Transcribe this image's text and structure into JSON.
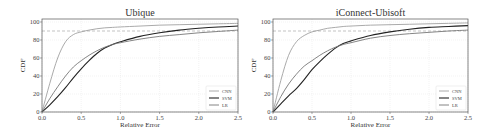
{
  "chart_data": [
    {
      "type": "line",
      "title": "Ubique",
      "xlabel": "Relative Error",
      "ylabel": "CDF",
      "xlim": [
        0,
        2.5
      ],
      "ylim": [
        0,
        100
      ],
      "xticks": [
        "0.0",
        "0.5",
        "1.0",
        "1.5",
        "2.0",
        "2.5"
      ],
      "yticks": [
        "0",
        "20",
        "40",
        "60",
        "80",
        "100"
      ],
      "grid": true,
      "reference_line": {
        "y": 90,
        "style": "dashed"
      },
      "legend_position": "lower right",
      "x": [
        0,
        0.1,
        0.2,
        0.3,
        0.4,
        0.5,
        0.6,
        0.7,
        0.8,
        0.9,
        1.0,
        1.25,
        1.5,
        1.75,
        2.0,
        2.25,
        2.5
      ],
      "series": [
        {
          "name": "CNN",
          "color": "#a0a0a0",
          "values": [
            0,
            32,
            60,
            78,
            86,
            89,
            91,
            92.5,
            93.5,
            94,
            94.5,
            95.5,
            96.5,
            97,
            97.5,
            98,
            98.5
          ]
        },
        {
          "name": "SVM",
          "color": "#222222",
          "values": [
            0,
            8,
            17,
            27,
            38,
            48,
            57,
            65,
            71,
            75,
            78,
            84,
            88,
            91,
            93,
            94.5,
            95.5
          ]
        },
        {
          "name": "LR",
          "color": "#777777",
          "values": [
            0,
            15,
            28,
            40,
            50,
            57,
            63,
            68,
            72,
            75,
            77,
            81,
            84,
            86,
            88,
            89.5,
            91
          ]
        }
      ]
    },
    {
      "type": "line",
      "title": "iConnect-Ubisoft",
      "xlabel": "Relative Error",
      "ylabel": "CDF",
      "xlim": [
        0,
        2.5
      ],
      "ylim": [
        0,
        100
      ],
      "xticks": [
        "0.0",
        "0.5",
        "1.0",
        "1.5",
        "2.0",
        "2.5"
      ],
      "yticks": [
        "0",
        "20",
        "40",
        "60",
        "80",
        "100"
      ],
      "grid": true,
      "reference_line": {
        "y": 90,
        "style": "dashed"
      },
      "legend_position": "lower right",
      "x": [
        0,
        0.1,
        0.2,
        0.3,
        0.4,
        0.5,
        0.6,
        0.7,
        0.8,
        0.9,
        1.0,
        1.25,
        1.5,
        1.75,
        2.0,
        2.25,
        2.5
      ],
      "series": [
        {
          "name": "CNN",
          "color": "#a0a0a0",
          "values": [
            0,
            35,
            63,
            78,
            85,
            89,
            91,
            93,
            94,
            95,
            95.5,
            96.5,
            97,
            97.5,
            98,
            98.5,
            99
          ]
        },
        {
          "name": "SVM",
          "color": "#222222",
          "values": [
            0,
            9,
            18,
            26,
            36,
            47,
            56,
            64,
            71,
            76,
            79,
            85,
            89,
            92,
            94,
            95,
            96
          ]
        },
        {
          "name": "LR",
          "color": "#777777",
          "values": [
            0,
            17,
            31,
            42,
            51,
            57,
            63,
            68,
            72,
            75,
            77,
            82,
            85,
            87,
            88.5,
            90,
            91
          ]
        }
      ]
    }
  ]
}
